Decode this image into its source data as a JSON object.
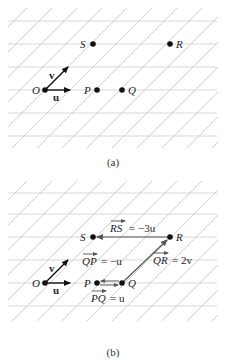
{
  "figure": {
    "panels": [
      {
        "id": "a",
        "caption": "(a)",
        "grid": {
          "horizontal_color": "#c8c8c8",
          "diagonal_color": "#b8b8b8"
        },
        "points": [
          {
            "label": "O",
            "role": "origin"
          },
          {
            "label": "P"
          },
          {
            "label": "Q"
          },
          {
            "label": "S"
          },
          {
            "label": "R"
          }
        ],
        "basis_vectors": [
          {
            "label": "u",
            "direction": "horizontal"
          },
          {
            "label": "v",
            "direction": "diagonal"
          }
        ]
      },
      {
        "id": "b",
        "caption": "(b)",
        "points": [
          {
            "label": "O"
          },
          {
            "label": "P"
          },
          {
            "label": "Q"
          },
          {
            "label": "S"
          },
          {
            "label": "R"
          }
        ],
        "basis_vectors": [
          {
            "label": "u"
          },
          {
            "label": "v"
          }
        ],
        "vector_equations": [
          {
            "vector": "RS",
            "rhs": "= −3u"
          },
          {
            "vector": "QR",
            "rhs": "= 2v"
          },
          {
            "vector": "QP",
            "rhs": "= −u"
          },
          {
            "vector": "PQ",
            "rhs": "= u"
          }
        ]
      }
    ]
  }
}
